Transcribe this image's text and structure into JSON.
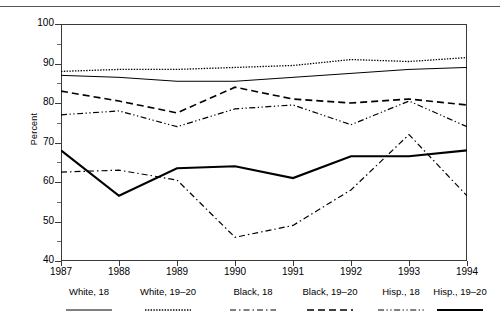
{
  "chart_data": {
    "type": "line",
    "title": "",
    "xlabel": "",
    "ylabel": "Percent",
    "x": [
      1987,
      1988,
      1989,
      1990,
      1991,
      1992,
      1993,
      1994
    ],
    "categories": [
      "1987",
      "1988",
      "1989",
      "1990",
      "1991",
      "1992",
      "1993",
      "1994"
    ],
    "xlim": [
      1987,
      1994
    ],
    "ylim": [
      40,
      100
    ],
    "ytick_labels": [
      "100",
      "90",
      "80",
      "70",
      "60",
      "50",
      "40"
    ],
    "ytick_values": [
      100,
      90,
      80,
      70,
      60,
      50,
      40
    ],
    "grid": false,
    "legend_position": "bottom",
    "series": [
      {
        "name": "White, 18",
        "style": "solid-thin",
        "values": [
          87.0,
          86.5,
          85.5,
          85.5,
          86.5,
          87.5,
          88.5,
          89.0
        ]
      },
      {
        "name": "White, 19–20",
        "style": "dotted",
        "values": [
          88.0,
          88.5,
          88.5,
          89.0,
          89.5,
          91.0,
          90.5,
          91.5
        ]
      },
      {
        "name": "Black, 18",
        "style": "dash-dot",
        "values": [
          62.5,
          63.0,
          60.5,
          46.0,
          49.0,
          58.0,
          72.0,
          56.5
        ]
      },
      {
        "name": "Black, 19–20",
        "style": "dashed",
        "values": [
          83.0,
          80.5,
          77.5,
          84.0,
          81.0,
          80.0,
          81.0,
          79.5
        ]
      },
      {
        "name": "Hisp., 18",
        "style": "dash-dot-dot",
        "values": [
          77.0,
          78.0,
          74.0,
          78.5,
          79.5,
          74.5,
          80.5,
          74.0
        ]
      },
      {
        "name": "Hisp., 19–20",
        "style": "solid-thick",
        "values": [
          68.0,
          56.5,
          63.5,
          64.0,
          61.0,
          66.5,
          66.5,
          68.0
        ]
      }
    ]
  },
  "legend": {
    "items": [
      {
        "label": "White, 18",
        "style": "solid-thin"
      },
      {
        "label": "White, 19–20",
        "style": "dotted"
      },
      {
        "label": "Black, 18",
        "style": "dash-dot"
      },
      {
        "label": "Black, 19–20",
        "style": "dashed"
      },
      {
        "label": "Hisp., 18",
        "style": "dash-dot-dot"
      },
      {
        "label": "Hisp., 19–20",
        "style": "solid-thick"
      }
    ]
  },
  "colors": {
    "line": "#000000",
    "axis": "#3a3a3a",
    "background": "#ffffff"
  }
}
